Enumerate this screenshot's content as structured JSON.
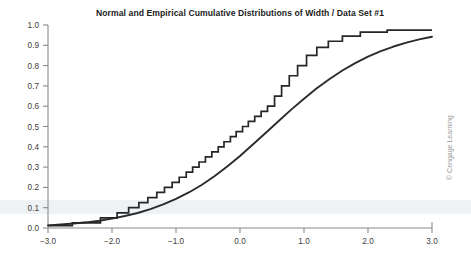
{
  "credit": "© Cengage Learning",
  "chart_data": {
    "type": "line",
    "title": "Normal and Empirical Cumulative Distributions of Width / Data Set #1",
    "xlabel": "",
    "ylabel": "",
    "xlim": [
      -3.0,
      3.0
    ],
    "ylim": [
      0.0,
      1.0
    ],
    "grid": false,
    "legend": "none",
    "xticks": [
      -3.0,
      -2.0,
      -1.0,
      0.0,
      1.0,
      2.0,
      3.0
    ],
    "xtick_labels": [
      "-3.0",
      "-2.0",
      "-1.0",
      "0.0",
      "1.0",
      "2.0",
      "3.0"
    ],
    "yticks": [
      0.0,
      0.1,
      0.2,
      0.3,
      0.4,
      0.5,
      0.6,
      0.7,
      0.8,
      0.9,
      1.0
    ],
    "ytick_labels": [
      "0.0",
      "0.1",
      "0.2",
      "0.3",
      "0.4",
      "0.5",
      "0.6",
      "0.7",
      "0.8",
      "0.9",
      "1.0"
    ],
    "series": [
      {
        "name": "Normal cumulative distribution",
        "type": "smooth",
        "x": [
          -3.0,
          -2.8,
          -2.6,
          -2.4,
          -2.2,
          -2.0,
          -1.8,
          -1.6,
          -1.4,
          -1.2,
          -1.0,
          -0.8,
          -0.6,
          -0.4,
          -0.2,
          0.0,
          0.2,
          0.4,
          0.6,
          0.8,
          1.0,
          1.2,
          1.4,
          1.6,
          1.8,
          2.0,
          2.2,
          2.4,
          2.6,
          2.8,
          3.0
        ],
        "values": [
          0.013,
          0.017,
          0.022,
          0.028,
          0.036,
          0.046,
          0.059,
          0.074,
          0.093,
          0.116,
          0.143,
          0.175,
          0.212,
          0.255,
          0.303,
          0.355,
          0.411,
          0.468,
          0.526,
          0.583,
          0.637,
          0.688,
          0.734,
          0.776,
          0.812,
          0.844,
          0.871,
          0.894,
          0.913,
          0.929,
          0.942
        ]
      },
      {
        "name": "Empirical cumulative distribution",
        "type": "step",
        "x": [
          -3.0,
          -2.62,
          -2.62,
          -2.18,
          -2.18,
          -1.92,
          -1.92,
          -1.74,
          -1.74,
          -1.58,
          -1.58,
          -1.44,
          -1.44,
          -1.3,
          -1.3,
          -1.18,
          -1.18,
          -1.06,
          -1.06,
          -0.95,
          -0.95,
          -0.84,
          -0.84,
          -0.74,
          -0.74,
          -0.64,
          -0.64,
          -0.54,
          -0.54,
          -0.44,
          -0.44,
          -0.34,
          -0.34,
          -0.25,
          -0.25,
          -0.15,
          -0.15,
          -0.06,
          -0.06,
          0.04,
          0.04,
          0.13,
          0.13,
          0.23,
          0.23,
          0.33,
          0.33,
          0.43,
          0.43,
          0.54,
          0.54,
          0.65,
          0.65,
          0.77,
          0.77,
          0.9,
          0.9,
          1.04,
          1.04,
          1.2,
          1.2,
          1.38,
          1.38,
          1.6,
          1.6,
          1.88,
          1.88,
          2.3,
          2.3,
          3.0
        ],
        "values": [
          0.012,
          0.012,
          0.025,
          0.025,
          0.05,
          0.05,
          0.075,
          0.075,
          0.1,
          0.1,
          0.125,
          0.125,
          0.15,
          0.15,
          0.175,
          0.175,
          0.2,
          0.2,
          0.225,
          0.225,
          0.25,
          0.25,
          0.275,
          0.275,
          0.3,
          0.3,
          0.325,
          0.325,
          0.35,
          0.35,
          0.375,
          0.375,
          0.4,
          0.4,
          0.425,
          0.425,
          0.45,
          0.45,
          0.475,
          0.475,
          0.5,
          0.5,
          0.525,
          0.525,
          0.55,
          0.55,
          0.575,
          0.575,
          0.6,
          0.6,
          0.65,
          0.65,
          0.7,
          0.7,
          0.75,
          0.75,
          0.8,
          0.8,
          0.85,
          0.85,
          0.89,
          0.89,
          0.92,
          0.92,
          0.945,
          0.945,
          0.965,
          0.965,
          0.975,
          0.975
        ]
      }
    ]
  }
}
